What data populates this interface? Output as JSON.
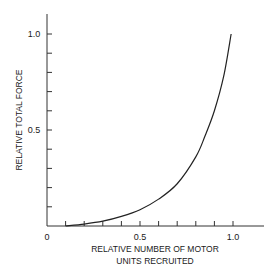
{
  "chart_data": {
    "type": "line",
    "title": "",
    "xlabel": "RELATIVE NUMBER OF MOTOR UNITS RECRUITED",
    "xlabel_lines": [
      "RELATIVE NUMBER OF MOTOR",
      "UNITS RECRUITED"
    ],
    "ylabel": "RELATIVE TOTAL FORCE",
    "xlim": [
      0,
      1.15
    ],
    "ylim": [
      0,
      1.1
    ],
    "x_ticks": [
      0.1,
      0.2,
      0.3,
      0.4,
      0.5,
      0.6,
      0.7,
      0.8,
      0.9,
      1.0
    ],
    "x_tick_labels": {
      "0": "0",
      "0.5": "0.5",
      "1.0": "1.0"
    },
    "y_ticks": [
      0.1,
      0.2,
      0.3,
      0.4,
      0.5,
      0.6,
      0.7,
      0.8,
      0.9,
      1.0
    ],
    "y_tick_labels": {
      "0.5": "0.5",
      "1.0": "1.0"
    },
    "grid": false,
    "legend": null,
    "series": [
      {
        "name": "force-recruitment curve",
        "color": "#222222",
        "x": [
          0.1,
          0.2,
          0.3,
          0.4,
          0.5,
          0.6,
          0.7,
          0.8,
          0.85,
          0.9,
          0.95,
          0.99
        ],
        "y": [
          0.0,
          0.01,
          0.025,
          0.05,
          0.085,
          0.14,
          0.22,
          0.36,
          0.47,
          0.6,
          0.78,
          1.0
        ]
      }
    ]
  },
  "labels": {
    "origin": "0",
    "x_mid": "0.5",
    "x_max": "1.0",
    "y_mid": "0.5",
    "y_max": "1.0",
    "xlabel_line1": "RELATIVE NUMBER OF MOTOR",
    "xlabel_line2": "UNITS RECRUITED",
    "ylabel": "RELATIVE TOTAL FORCE"
  }
}
